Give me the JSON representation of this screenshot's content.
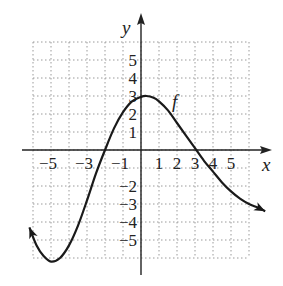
{
  "chart_data": {
    "type": "line",
    "title": "",
    "xlabel": "x",
    "ylabel": "y",
    "function_label": "f",
    "xlim": [
      -6,
      6
    ],
    "ylim": [
      -6,
      6
    ],
    "grid": true,
    "grid_style": "dotted",
    "x_tick_labels": [
      "-5",
      "-3",
      "-1",
      "1",
      "2",
      "3",
      "4",
      "5"
    ],
    "x_tick_values": [
      -5,
      -3,
      -1,
      1,
      2,
      3,
      4,
      5
    ],
    "y_tick_labels": [
      "5",
      "4",
      "3",
      "2",
      "1",
      "-2",
      "-3",
      "-4",
      "-5"
    ],
    "y_tick_values": [
      5,
      4,
      3,
      2,
      1,
      -2,
      -3,
      -4,
      -5
    ],
    "series": [
      {
        "name": "f",
        "x": [
          -6.2,
          -5.8,
          -5.4,
          -5.0,
          -4.5,
          -4.0,
          -3.5,
          -3.0,
          -2.5,
          -2.0,
          -1.5,
          -1.0,
          -0.5,
          0.0,
          0.3,
          0.7,
          1.0,
          1.5,
          2.0,
          2.5,
          3.0,
          3.5,
          4.0,
          4.5,
          5.0,
          5.5,
          6.0,
          6.5,
          6.9
        ],
        "y": [
          -4.3,
          -5.3,
          -5.9,
          -6.2,
          -6.0,
          -5.3,
          -4.2,
          -2.8,
          -1.3,
          0.0,
          1.2,
          2.1,
          2.7,
          2.95,
          3.0,
          2.9,
          2.7,
          2.2,
          1.5,
          0.8,
          0.1,
          -0.6,
          -1.2,
          -1.8,
          -2.3,
          -2.7,
          -3.0,
          -3.2,
          -3.4
        ],
        "arrows": "both ends"
      }
    ],
    "key_points": {
      "x_intercepts": [
        -2,
        3.1
      ],
      "local_max": [
        0.2,
        3
      ],
      "local_min": [
        -5,
        -6.2
      ]
    }
  }
}
